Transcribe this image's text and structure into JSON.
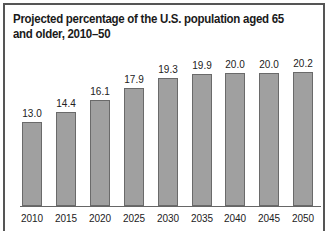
{
  "chart_data": {
    "type": "bar",
    "title": "Projected percentage of the U.S. population aged 65 and older, 2010–50",
    "xlabel": "",
    "ylabel": "",
    "categories": [
      "2010",
      "2015",
      "2020",
      "2025",
      "2030",
      "2035",
      "2040",
      "2045",
      "2050"
    ],
    "values": [
      13.0,
      14.4,
      16.1,
      17.9,
      19.3,
      19.9,
      20.0,
      20.0,
      20.2
    ],
    "value_labels": [
      "13.0",
      "14.4",
      "16.1",
      "17.9",
      "19.3",
      "19.9",
      "20.0",
      "20.0",
      "20.2"
    ],
    "grid": false,
    "legend": null,
    "bar_color": "#a0a0a0",
    "bar_edge_color": "#6a6a6a"
  }
}
